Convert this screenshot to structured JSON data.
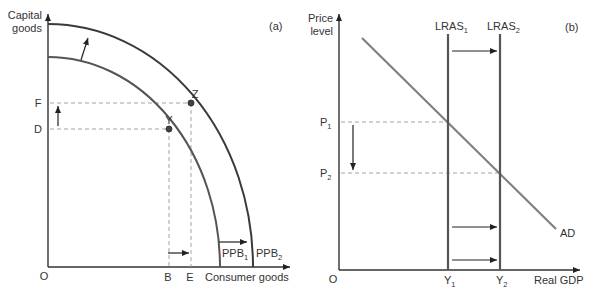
{
  "panel_a": {
    "tag": "(a)",
    "y_axis_label_line1": "Capital",
    "y_axis_label_line2": "goods",
    "x_axis_label": "Consumer goods",
    "origin": "O",
    "y_ticks": {
      "F": "F",
      "D": "D"
    },
    "x_ticks": {
      "B": "B",
      "E": "E"
    },
    "points": {
      "Y": "Y",
      "Z": "Z"
    },
    "curves": {
      "ppb1": {
        "name": "PPB",
        "sub": "1"
      },
      "ppb2": {
        "name": "PPB",
        "sub": "2"
      }
    }
  },
  "panel_b": {
    "tag": "(b)",
    "y_axis_label_line1": "Price",
    "y_axis_label_line2": "level",
    "x_axis_label": "Real GDP",
    "origin": "O",
    "y_ticks": {
      "p1": {
        "name": "P",
        "sub": "1"
      },
      "p2": {
        "name": "P",
        "sub": "2"
      }
    },
    "x_ticks": {
      "y1": {
        "name": "Y",
        "sub": "1"
      },
      "y2": {
        "name": "Y",
        "sub": "2"
      }
    },
    "curves": {
      "lras1": {
        "name": "LRAS",
        "sub": "1"
      },
      "lras2": {
        "name": "LRAS",
        "sub": "2"
      },
      "ad": "AD"
    }
  },
  "colors": {
    "axis": "#333333",
    "curve_dark": "#3a3a3a",
    "curve_mid": "#555555",
    "ad_line": "#808080",
    "dashed": "#999999",
    "point_fill": "#444444"
  }
}
